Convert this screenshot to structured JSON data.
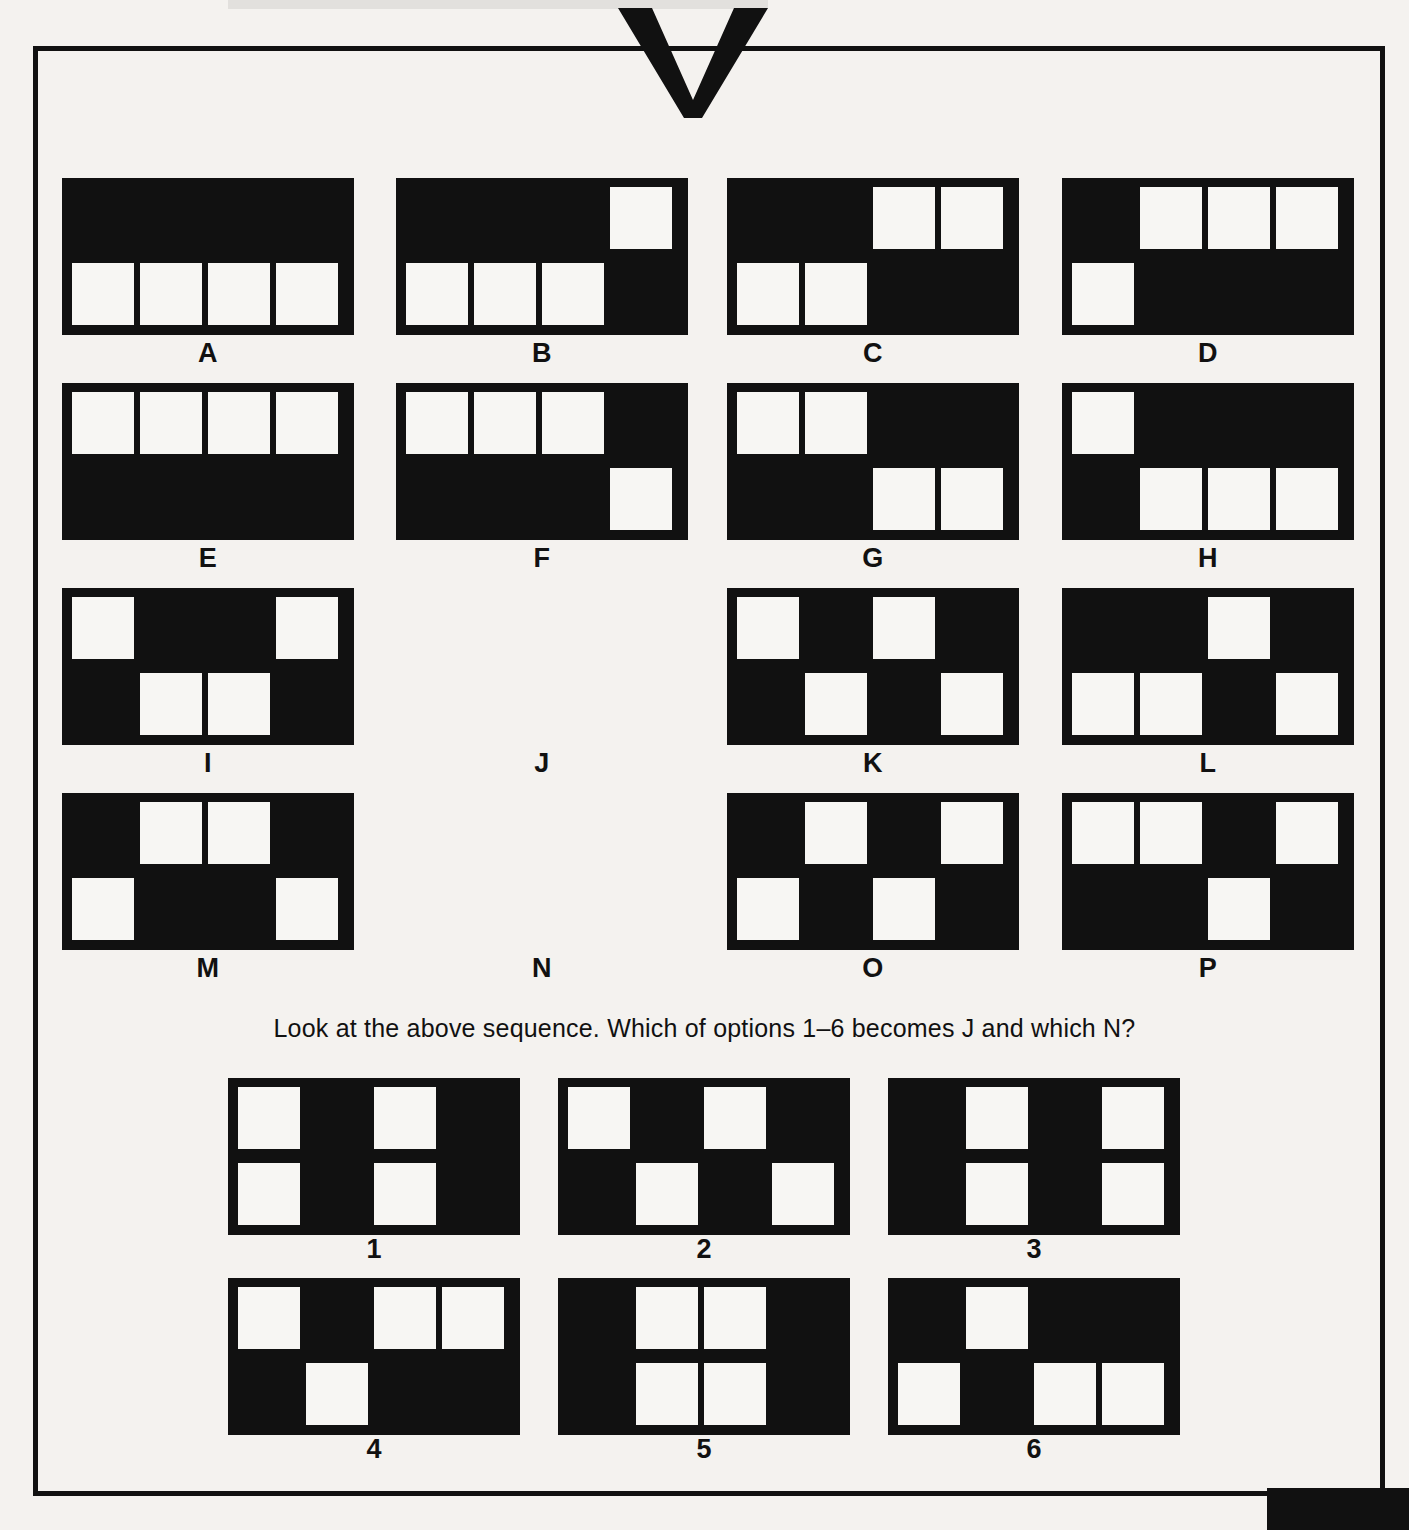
{
  "puzzle": {
    "question": "Look at the above sequence. Which of options  1–6 becomes J and which N?",
    "grid": {
      "columns": 4,
      "rows": 2
    },
    "colors": {
      "ink": "#111111",
      "paper": "#f4f2ef",
      "cell": "#f7f6f3"
    },
    "sequence": [
      {
        "label": "A",
        "top": [
          0,
          0,
          0,
          0
        ],
        "bottom": [
          1,
          1,
          1,
          1
        ],
        "empty": false
      },
      {
        "label": "B",
        "top": [
          0,
          0,
          0,
          1
        ],
        "bottom": [
          1,
          1,
          1,
          0
        ],
        "empty": false
      },
      {
        "label": "C",
        "top": [
          0,
          0,
          1,
          1
        ],
        "bottom": [
          1,
          1,
          0,
          0
        ],
        "empty": false
      },
      {
        "label": "D",
        "top": [
          0,
          1,
          1,
          1
        ],
        "bottom": [
          1,
          0,
          0,
          0
        ],
        "empty": false
      },
      {
        "label": "E",
        "top": [
          1,
          1,
          1,
          1
        ],
        "bottom": [
          0,
          0,
          0,
          0
        ],
        "empty": false
      },
      {
        "label": "F",
        "top": [
          1,
          1,
          1,
          0
        ],
        "bottom": [
          0,
          0,
          0,
          1
        ],
        "empty": false
      },
      {
        "label": "G",
        "top": [
          1,
          1,
          0,
          0
        ],
        "bottom": [
          0,
          0,
          1,
          1
        ],
        "empty": false
      },
      {
        "label": "H",
        "top": [
          1,
          0,
          0,
          0
        ],
        "bottom": [
          0,
          1,
          1,
          1
        ],
        "empty": false
      },
      {
        "label": "I",
        "top": [
          1,
          0,
          0,
          1
        ],
        "bottom": [
          0,
          1,
          1,
          0
        ],
        "empty": false
      },
      {
        "label": "J",
        "top": [
          0,
          0,
          0,
          0
        ],
        "bottom": [
          0,
          0,
          0,
          0
        ],
        "empty": true
      },
      {
        "label": "K",
        "top": [
          1,
          0,
          1,
          0
        ],
        "bottom": [
          0,
          1,
          0,
          1
        ],
        "empty": false
      },
      {
        "label": "L",
        "top": [
          0,
          0,
          1,
          0
        ],
        "bottom": [
          1,
          1,
          0,
          1
        ],
        "empty": false
      },
      {
        "label": "M",
        "top": [
          0,
          1,
          1,
          0
        ],
        "bottom": [
          1,
          0,
          0,
          1
        ],
        "empty": false
      },
      {
        "label": "N",
        "top": [
          0,
          0,
          0,
          0
        ],
        "bottom": [
          0,
          0,
          0,
          0
        ],
        "empty": true
      },
      {
        "label": "O",
        "top": [
          0,
          1,
          0,
          1
        ],
        "bottom": [
          1,
          0,
          1,
          0
        ],
        "empty": false
      },
      {
        "label": "P",
        "top": [
          1,
          1,
          0,
          1
        ],
        "bottom": [
          0,
          0,
          1,
          0
        ],
        "empty": false
      }
    ],
    "options": [
      {
        "label": "1",
        "top": [
          1,
          0,
          1,
          0
        ],
        "bottom": [
          1,
          0,
          1,
          0
        ]
      },
      {
        "label": "2",
        "top": [
          1,
          0,
          1,
          0
        ],
        "bottom": [
          0,
          1,
          0,
          1
        ]
      },
      {
        "label": "3",
        "top": [
          0,
          1,
          0,
          1
        ],
        "bottom": [
          0,
          1,
          0,
          1
        ]
      },
      {
        "label": "4",
        "top": [
          1,
          0,
          1,
          1
        ],
        "bottom": [
          0,
          1,
          0,
          0
        ]
      },
      {
        "label": "5",
        "top": [
          0,
          1,
          1,
          0
        ],
        "bottom": [
          0,
          1,
          1,
          0
        ]
      },
      {
        "label": "6",
        "top": [
          0,
          1,
          0,
          0
        ],
        "bottom": [
          1,
          0,
          1,
          1
        ]
      }
    ]
  }
}
